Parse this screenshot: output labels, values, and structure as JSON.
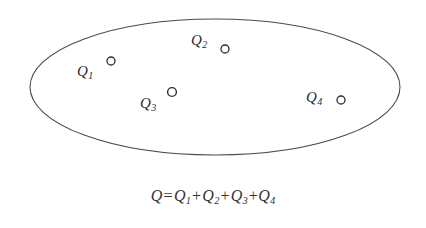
{
  "figure": {
    "type": "physics-diagram",
    "background_color": "#ffffff",
    "boundary": {
      "shape": "ellipse",
      "name": "closed-surface-ellipse",
      "stroke_color": "#4a4a4a",
      "fill": "none",
      "center_x": 215,
      "center_y": 87,
      "radius_x": 185,
      "radius_y": 68,
      "stroke_width": 1.1
    },
    "charges": [
      {
        "id": "q1",
        "label_base": "Q",
        "label_sub": "1",
        "marker_x": 111,
        "marker_y": 61,
        "marker_radius": 4,
        "label_x": 77,
        "label_y": 64
      },
      {
        "id": "q2",
        "label_base": "Q",
        "label_sub": "2",
        "marker_x": 225,
        "marker_y": 49,
        "marker_radius": 4,
        "label_x": 191,
        "label_y": 33
      },
      {
        "id": "q3",
        "label_base": "Q",
        "label_sub": "3",
        "marker_x": 172,
        "marker_y": 92,
        "marker_radius": 4,
        "label_x": 140,
        "label_y": 96
      },
      {
        "id": "q4",
        "label_base": "Q",
        "label_sub": "4",
        "marker_x": 341,
        "marker_y": 100,
        "marker_radius": 4,
        "label_x": 306,
        "label_y": 90
      }
    ],
    "marker_stroke_color": "#2b2b2b",
    "marker_fill_color": "#ffffff",
    "label_color": "#2b2b2b"
  },
  "equation": {
    "name": "total-charge-equation",
    "text": "Q = Q1 + Q2 + Q3 +Q4",
    "lhs": "Q",
    "equals": "=",
    "terms": [
      {
        "base": "Q",
        "sub": "1"
      },
      {
        "base": "Q",
        "sub": "2"
      },
      {
        "base": "Q",
        "sub": "3"
      },
      {
        "base": "Q",
        "sub": "4"
      }
    ],
    "plus": "+",
    "color": "#333333"
  }
}
